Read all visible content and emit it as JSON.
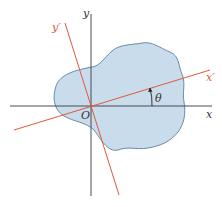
{
  "diagram": {
    "type": "rotated-axes",
    "labels": {
      "x": "x",
      "y": "y",
      "x_prime": "x′",
      "y_prime": "y′",
      "origin": "O",
      "angle": "θ"
    },
    "colors": {
      "region_fill": "#c9dcec",
      "region_stroke": "#5b7fa0",
      "axis": "#4a4a55",
      "rotated_axis": "#e0583a",
      "text": "#333333",
      "rotated_text": "#e0583a"
    }
  }
}
